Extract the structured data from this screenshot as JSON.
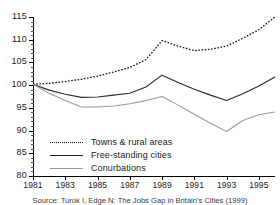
{
  "chart_data": {
    "type": "line",
    "title": "",
    "subtitle": "",
    "xlabel": "",
    "ylabel": "",
    "xlim": [
      1981,
      1996
    ],
    "ylim": [
      80,
      115
    ],
    "grid": false,
    "legend_position": "inside-bottom-left",
    "x": [
      1981,
      1982,
      1983,
      1984,
      1985,
      1986,
      1987,
      1988,
      1989,
      1990,
      1991,
      1992,
      1993,
      1994,
      1995,
      1996
    ],
    "ytick_labels": [
      "80",
      "85",
      "90",
      "95",
      "100",
      "105",
      "110",
      "115"
    ],
    "ytick_values": [
      80,
      85,
      90,
      95,
      100,
      105,
      110,
      115
    ],
    "xtick_labels": [
      "1981",
      "1983",
      "1985",
      "1987",
      "1989",
      "1991",
      "1993",
      "1995"
    ],
    "xtick_values": [
      1981,
      1983,
      1985,
      1987,
      1989,
      1991,
      1993,
      1995
    ],
    "series": [
      {
        "name": "Towns & rural areas",
        "style": "dotted",
        "color": "#111111",
        "values": [
          100.2,
          100.4,
          100.8,
          101.3,
          102.0,
          102.9,
          103.9,
          105.6,
          109.8,
          108.6,
          107.6,
          107.9,
          108.6,
          110.3,
          112.2,
          115.0
        ]
      },
      {
        "name": "Free-standing cities",
        "style": "solid",
        "color": "#2b2b2b",
        "values": [
          100.2,
          98.9,
          98.0,
          97.3,
          97.4,
          97.8,
          98.2,
          99.6,
          102.2,
          100.6,
          99.1,
          97.8,
          96.6,
          98.1,
          99.8,
          101.8
        ]
      },
      {
        "name": "Conurbations",
        "style": "solid",
        "color": "#9a9a9a",
        "values": [
          100.2,
          98.2,
          96.6,
          95.2,
          95.2,
          95.4,
          95.9,
          96.6,
          97.5,
          95.6,
          93.6,
          91.6,
          89.8,
          92.2,
          93.5,
          94.1
        ]
      }
    ]
  },
  "legend": {
    "items": [
      {
        "label": "Towns & rural areas"
      },
      {
        "label": "Free-standing cities"
      },
      {
        "label": "Conurbations"
      }
    ]
  },
  "source": {
    "text": "Source: Turok I, Edge N: The Jobs Gap in Britain's Cities (1999)"
  }
}
